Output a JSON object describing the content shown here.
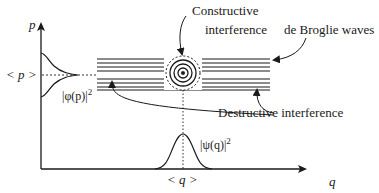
{
  "diagram": {
    "axes": {
      "p_axis_label": "p",
      "q_axis_label": "q",
      "p_mean_label": "< p >",
      "q_mean_label": "< q >"
    },
    "distributions": {
      "momentum_label": "|φ(p)|",
      "momentum_exponent": "2",
      "position_label": "|ψ(q)|",
      "position_exponent": "2"
    },
    "annotations": {
      "constructive_line1": "Constructive",
      "constructive_line2": "interference",
      "de_broglie": "de Broglie waves",
      "destructive": "Destructive interference"
    },
    "colors": {
      "ink": "#1a1a1a",
      "background": "#ffffff"
    }
  }
}
